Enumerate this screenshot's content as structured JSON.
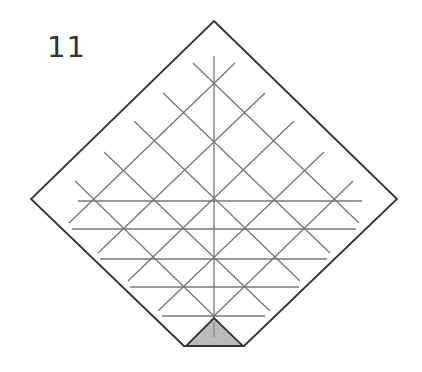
{
  "step": {
    "number": "11"
  },
  "diagram": {
    "colors": {
      "outline": "#333333",
      "crease": "#777777",
      "flap_fill": "#bbbbbb"
    },
    "outline_points": "214,21 397,199 244,346 184,346 31,199",
    "flap_triangle_points": "186,346 243,346 214,318",
    "vertical_crease": {
      "x1": 214,
      "y1": 56,
      "x2": 214,
      "y2": 337
    },
    "horizontal_creases": [
      {
        "y": 201,
        "x1": 78,
        "x2": 362
      },
      {
        "y": 229,
        "x1": 72,
        "x2": 356
      },
      {
        "y": 259,
        "x1": 100,
        "x2": 327
      },
      {
        "y": 287,
        "x1": 130,
        "x2": 299
      },
      {
        "y": 316,
        "x1": 162,
        "x2": 265
      }
    ],
    "diagonal_creases_down_right": [
      {
        "x1": 193,
        "y1": 63,
        "x2": 359,
        "y2": 223
      },
      {
        "x1": 163,
        "y1": 93,
        "x2": 330,
        "y2": 253
      },
      {
        "x1": 134,
        "y1": 121,
        "x2": 300,
        "y2": 281
      },
      {
        "x1": 104,
        "y1": 152,
        "x2": 270,
        "y2": 311
      },
      {
        "x1": 75,
        "y1": 181,
        "x2": 214,
        "y2": 316
      }
    ],
    "diagonal_creases_up_right": [
      {
        "x1": 69,
        "y1": 223,
        "x2": 235,
        "y2": 63
      },
      {
        "x1": 98,
        "y1": 253,
        "x2": 265,
        "y2": 93
      },
      {
        "x1": 128,
        "y1": 281,
        "x2": 294,
        "y2": 121
      },
      {
        "x1": 158,
        "y1": 311,
        "x2": 324,
        "y2": 152
      },
      {
        "x1": 214,
        "y1": 316,
        "x2": 353,
        "y2": 181
      }
    ]
  }
}
